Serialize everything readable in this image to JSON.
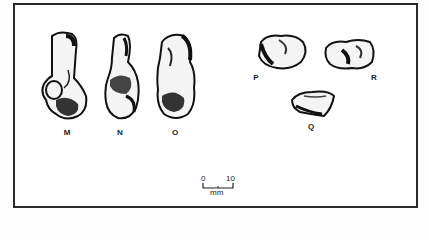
{
  "figure": {
    "specimens": [
      {
        "id": "M",
        "label": "M"
      },
      {
        "id": "N",
        "label": "N"
      },
      {
        "id": "O",
        "label": "O"
      },
      {
        "id": "P",
        "label": "P"
      },
      {
        "id": "R",
        "label": "R"
      },
      {
        "id": "Q",
        "label": "Q"
      }
    ],
    "scale_bar": {
      "start": "0",
      "end": "10",
      "unit": "mm"
    }
  }
}
